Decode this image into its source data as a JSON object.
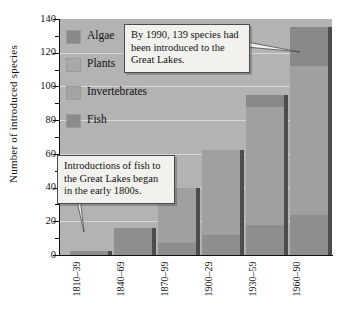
{
  "chart_data": {
    "type": "bar",
    "stacked": true,
    "title": "",
    "xlabel": "",
    "ylabel": "Number of introduced species",
    "ylim": [
      0,
      140
    ],
    "yticks": [
      0,
      20,
      40,
      60,
      80,
      100,
      120,
      140
    ],
    "ytick_labels": [
      "0",
      "20",
      "40",
      "60",
      "80",
      "100",
      "120",
      "140"
    ],
    "grid": true,
    "legend_position": "inside-top-left",
    "categories": [
      "1810–39",
      "1840–69",
      "1870–99",
      "1900–29",
      "1930–59",
      "1960–90"
    ],
    "series": [
      {
        "name": "Fish",
        "values": [
          2,
          16,
          7,
          12,
          18,
          24
        ]
      },
      {
        "name": "Invertebrates",
        "values": [
          0,
          0,
          33,
          50,
          70,
          88
        ]
      },
      {
        "name": "Plants",
        "values": [
          0,
          0,
          0,
          0,
          0,
          0
        ]
      },
      {
        "name": "Algae",
        "values": [
          0,
          0,
          0,
          0,
          7,
          23
        ]
      }
    ],
    "totals": [
      2,
      16,
      40,
      62,
      95,
      135
    ],
    "annotations": [
      "By 1990, 139 species had been introduced to the Great Lakes.",
      "Introductions of fish to the Great Lakes began in the early 1800s."
    ]
  },
  "axis": {
    "y_title": "Number of introduced species",
    "y_ticks": [
      "140",
      "120",
      "100",
      "80",
      "60",
      "40",
      "20",
      "0"
    ],
    "x_ticks": [
      "1810–39",
      "1840–69",
      "1870–99",
      "1900–29",
      "1930–59",
      "1960–90"
    ]
  },
  "legend": {
    "items": [
      {
        "label": "Algae",
        "color": "#8a8a8a"
      },
      {
        "label": "Plants",
        "color": "#a9a9a9"
      },
      {
        "label": "Invertebrates",
        "color": "#a4a4a4"
      },
      {
        "label": "Fish",
        "color": "#8c8c8c"
      }
    ]
  },
  "callouts": {
    "top": "By 1990, 139 species had been introduced to the Great Lakes.",
    "bottom": "Introductions of fish to the Great Lakes began in the early 1800s."
  },
  "colors": {
    "plot_background": "#b3b3b3",
    "gridline": "#d8d8d8",
    "axis": "#101010",
    "bar_shadow": "#4c4c4c",
    "callout_background": "#f2f1ee"
  }
}
